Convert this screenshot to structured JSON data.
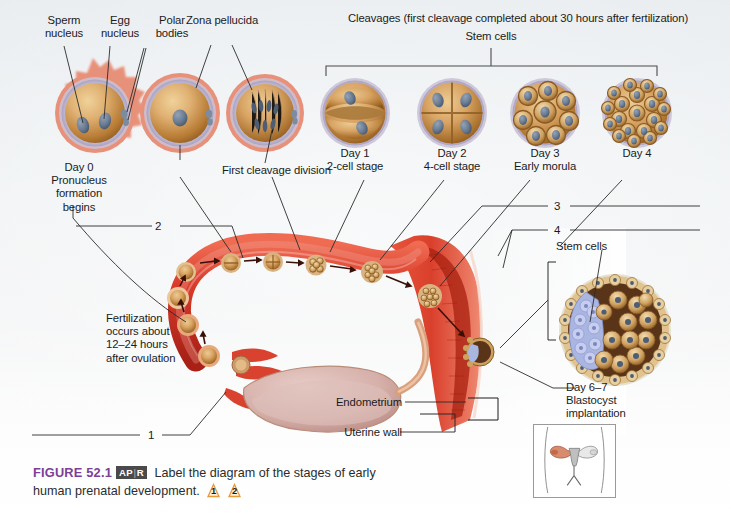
{
  "figure": {
    "background_color": "#eceff2",
    "caption_number": "FIGURE 52.1",
    "caption_number_color": "#7b3f98",
    "apr_badge_left": "AP",
    "apr_badge_sep": "|",
    "apr_badge_right": "R",
    "caption_text_1": " Label the diagram of the stages of early",
    "caption_text_2": "human prenatal development. ",
    "flag_1": "1",
    "flag_2": "2"
  },
  "top_row": {
    "bracket_title": "Cleavages (first cleavage completed about 30 hours after fertilization)",
    "stem_cells_label": "Stem cells",
    "callouts": [
      {
        "id": "sperm-nucleus",
        "text": "Sperm\nnucleus"
      },
      {
        "id": "egg-nucleus",
        "text": "Egg\nnucleus"
      },
      {
        "id": "polar-bodies",
        "text": "Polar\nbodies"
      },
      {
        "id": "zona-pellucida",
        "text": "Zona pellucida"
      }
    ],
    "stages": [
      {
        "id": "zygote-day0",
        "caption": "Day 0\nPronucleus\nformation\nbegins",
        "kind": "zygote-two-pronuclei"
      },
      {
        "id": "pronucleus",
        "caption": "",
        "kind": "zygote-single"
      },
      {
        "id": "first-cleavage",
        "caption": "First cleavage division",
        "kind": "spindle"
      },
      {
        "id": "two-cell",
        "caption": "Day 1\n2-cell stage",
        "kind": "cells-2"
      },
      {
        "id": "four-cell",
        "caption": "Day 2\n4-cell stage",
        "kind": "cells-4"
      },
      {
        "id": "early-morula",
        "caption": "Day 3\nEarly morula",
        "kind": "morula-early"
      },
      {
        "id": "morula-day4",
        "caption": "Day 4",
        "kind": "morula-late"
      }
    ]
  },
  "diagram": {
    "fertilization_note": "Fertilization\noccurs about\n12–24 hours\nafter ovulation",
    "endometrium_label": "Endometrium",
    "uterine_wall_label": "Uterine wall",
    "blastocyst_stem_cells_label": "Stem cells",
    "blastocyst_caption": "Day 6–7\nBlastocyst\nimplantation",
    "leader_numbers": [
      "1",
      "2",
      "3",
      "4"
    ]
  },
  "colors": {
    "corona": "#e8917a",
    "zona": "#b9b3cf",
    "cytoplasm_light": "#e3b97a",
    "cytoplasm_dark": "#9a6a2d",
    "nucleus": "#6d7f96",
    "tube_red": "#d93b2b",
    "tube_red_dark": "#b02518",
    "uterus_red": "#e04b33",
    "ovary_pink": "#d9b2ae",
    "blastocyst_inner": "#a9b6e0",
    "blastocyst_cavity": "#5a3418",
    "trophoblast": "#e0c38f",
    "label_text": "#1b1b1b",
    "leader_line": "#333333",
    "figure_purple": "#7b3f98"
  }
}
